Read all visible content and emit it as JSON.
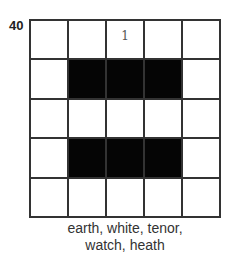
{
  "puzzle": {
    "number": "40",
    "grid": [
      [
        "",
        "",
        "1",
        "",
        ""
      ],
      [
        "",
        "#",
        "#",
        "#",
        ""
      ],
      [
        "",
        "",
        "",
        "",
        ""
      ],
      [
        "",
        "#",
        "#",
        "#",
        ""
      ],
      [
        "",
        "",
        "",
        "",
        ""
      ]
    ],
    "words_line1": "earth, white, tenor,",
    "words_line2": "watch, heath"
  }
}
